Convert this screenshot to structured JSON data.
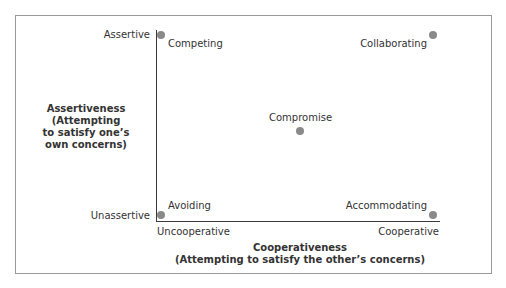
{
  "diagram": {
    "type": "quadrant-plot",
    "y_axis": {
      "title_lines": [
        "Assertiveness",
        "(Attempting",
        "to satisfy one’s",
        "own concerns)"
      ],
      "high_label": "Assertive",
      "low_label": "Unassertive"
    },
    "x_axis": {
      "title_lines": [
        "Cooperativeness",
        "(Attempting to satisfy the other’s concerns)"
      ],
      "low_label": "Uncooperative",
      "high_label": "Cooperative"
    },
    "points": [
      {
        "label": "Competing",
        "assertiveness": "high",
        "cooperativeness": "low"
      },
      {
        "label": "Collaborating",
        "assertiveness": "high",
        "cooperativeness": "high"
      },
      {
        "label": "Compromise",
        "assertiveness": "medium",
        "cooperativeness": "medium"
      },
      {
        "label": "Avoiding",
        "assertiveness": "low",
        "cooperativeness": "low"
      },
      {
        "label": "Accommodating",
        "assertiveness": "low",
        "cooperativeness": "high"
      }
    ],
    "colors": {
      "dot": "#8a8a8a",
      "axis": "#3a3a3a",
      "frame": "#9a9a9a",
      "text": "#333333"
    }
  }
}
